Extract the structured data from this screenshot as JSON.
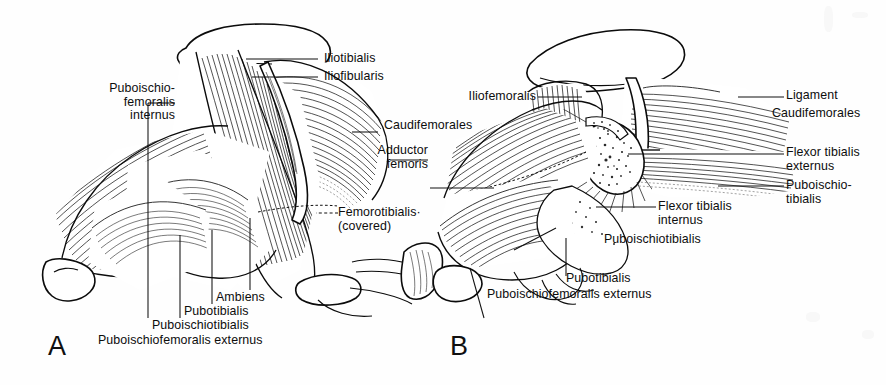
{
  "figure": {
    "background_color": "#fefefe",
    "ink_color": "#111111",
    "width": 886,
    "height": 385
  },
  "panels": [
    {
      "id": "A",
      "letter": "A",
      "labels": [
        {
          "key": "iliotibialis",
          "text": "Iliotibialis"
        },
        {
          "key": "iliofibularis",
          "text": "Iliofibularis"
        },
        {
          "key": "puboischiofemoralis_internus",
          "text": "Puboischio-\nfemoralis\ninternus"
        },
        {
          "key": "caudifemorales",
          "text": "Caudifemorales"
        },
        {
          "key": "adductor_femoris",
          "text": "Adductor\nfemoris"
        },
        {
          "key": "femorotibialis",
          "text": "Femorotibialis·\n(covered)"
        },
        {
          "key": "ambiens",
          "text": "Ambiens"
        },
        {
          "key": "pubotibialis",
          "text": "Pubotibialis"
        },
        {
          "key": "puboischiotibialis",
          "text": "Puboischiotibialis"
        },
        {
          "key": "puboischiofemoralis_externus",
          "text": "Puboischiofemoralis externus"
        }
      ]
    },
    {
      "id": "B",
      "letter": "B",
      "labels": [
        {
          "key": "iliofemoralis",
          "text": "Iliofemoralis"
        },
        {
          "key": "ligament",
          "text": "Ligament"
        },
        {
          "key": "caudifemorales",
          "text": "Caudifemorales"
        },
        {
          "key": "flexor_tibialis_externus",
          "text": "Flexor tibialis\nexternus"
        },
        {
          "key": "puboischiotibialis_right",
          "text": "Puboischio-\ntibialis"
        },
        {
          "key": "flexor_tibialis_internus",
          "text": "Flexor tibialis\ninternus"
        },
        {
          "key": "puboischiotibialis",
          "text": "Puboischiotibialis"
        },
        {
          "key": "pubotibialis",
          "text": "Pubotibialis"
        },
        {
          "key": "puboischiofemoralis_externus",
          "text": "Puboischiofemoralis externus"
        }
      ]
    }
  ]
}
